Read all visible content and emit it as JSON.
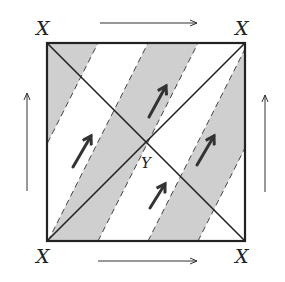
{
  "diagram": {
    "type": "identification-square",
    "colors": {
      "stroke": "#222222",
      "stripe_fill": "#cfcfcf",
      "background": "#ffffff",
      "arrow": "#333333"
    },
    "corner_labels": {
      "top_left": "X",
      "top_right": "X",
      "bottom_left": "X",
      "bottom_right": "X"
    },
    "center_label": "Y",
    "edge_arrows": {
      "top": "right",
      "bottom": "right",
      "left": "up",
      "right": "up"
    },
    "diagonals": [
      "top-left to bottom-right",
      "bottom-left to top-right"
    ],
    "stripes": {
      "count_visible": 4,
      "boundary_style": "dashed",
      "direction": "up-right"
    },
    "flow_arrows": [
      {
        "position": "upper-center",
        "direction": "up-right"
      },
      {
        "position": "left",
        "direction": "up-right"
      },
      {
        "position": "right",
        "direction": "up-right"
      },
      {
        "position": "lower-center",
        "direction": "up-right"
      }
    ]
  }
}
